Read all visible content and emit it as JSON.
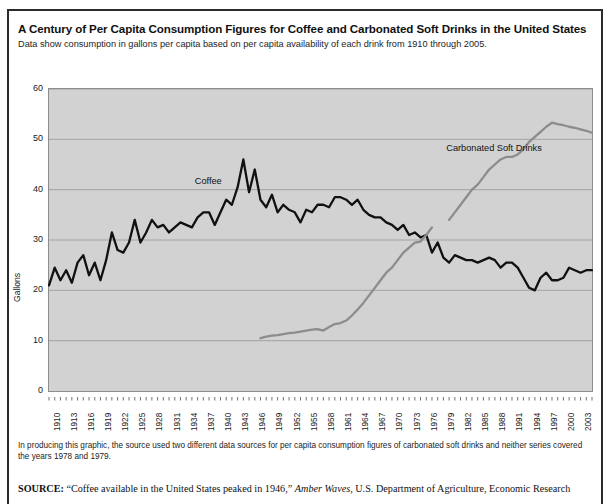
{
  "figure": {
    "title": "A Century of Per Capita Consumption Figures for Coffee and Carbonated Soft Drinks in the United States",
    "subtitle": "Data show consumption in gallons per capita based on per capita availability of each drink from 1910 through 2005.",
    "note": "In producing this graphic, the source used two different data sources for per capita consumption figures of carbonated soft drinks and neither series covered the years 1978 and 1979.",
    "source_prefix": "SOURCE:",
    "source_quote": "“Coffee available in the United States peaked in 1946,”",
    "source_italic": "Amber Waves",
    "source_rest": ", U.S. Department of Agriculture, Economic Research"
  },
  "colors": {
    "plot_background": "#d2d2d2",
    "gridline": "#8d8d8d",
    "coffee_line": "#111111",
    "soda_line": "#8c8c8c",
    "frame": "#2b2b2b",
    "text": "#1b1b1b"
  },
  "chart_data": {
    "type": "line",
    "title": "A Century of Per Capita Consumption Figures for Coffee and Carbonated Soft Drinks in the United States",
    "xlabel": "",
    "ylabel": "Gallons",
    "ylim": [
      0,
      60
    ],
    "xlim": [
      1910,
      2005
    ],
    "yticks": [
      0,
      10,
      20,
      30,
      40,
      50,
      60
    ],
    "xticks": [
      1910,
      1913,
      1916,
      1919,
      1922,
      1925,
      1928,
      1931,
      1934,
      1937,
      1940,
      1943,
      1946,
      1949,
      1952,
      1955,
      1958,
      1961,
      1964,
      1967,
      1970,
      1973,
      1976,
      1979,
      1982,
      1985,
      1988,
      1991,
      1994,
      1997,
      2000,
      2003
    ],
    "grid": true,
    "legend": "inline-labels",
    "series": [
      {
        "name": "Coffee",
        "color": "#111111",
        "label_x": 1939,
        "label_y": 41.5,
        "x": [
          1910,
          1911,
          1912,
          1913,
          1914,
          1915,
          1916,
          1917,
          1918,
          1919,
          1920,
          1921,
          1922,
          1923,
          1924,
          1925,
          1926,
          1927,
          1928,
          1929,
          1930,
          1931,
          1932,
          1933,
          1934,
          1935,
          1936,
          1937,
          1938,
          1939,
          1940,
          1941,
          1942,
          1943,
          1944,
          1945,
          1946,
          1947,
          1948,
          1949,
          1950,
          1951,
          1952,
          1953,
          1954,
          1955,
          1956,
          1957,
          1958,
          1959,
          1960,
          1961,
          1962,
          1963,
          1964,
          1965,
          1966,
          1967,
          1968,
          1969,
          1970,
          1971,
          1972,
          1973,
          1974,
          1975,
          1976,
          1977,
          1978,
          1979,
          1980,
          1981,
          1982,
          1983,
          1984,
          1985,
          1986,
          1987,
          1988,
          1989,
          1990,
          1991,
          1992,
          1993,
          1994,
          1995,
          1996,
          1997,
          1998,
          1999,
          2000,
          2001,
          2002,
          2003,
          2004,
          2005
        ],
        "y": [
          21.0,
          24.5,
          22.0,
          24.0,
          21.5,
          25.5,
          27.0,
          23.0,
          25.5,
          22.0,
          26.0,
          31.5,
          28.0,
          27.5,
          29.5,
          34.0,
          29.5,
          31.5,
          34.0,
          32.5,
          33.0,
          31.5,
          32.5,
          33.5,
          33.0,
          32.5,
          34.5,
          35.5,
          35.5,
          33.0,
          35.5,
          38.0,
          37.0,
          40.5,
          46.0,
          39.5,
          44.0,
          38.0,
          36.5,
          39.0,
          35.5,
          37.0,
          36.0,
          35.5,
          33.5,
          36.0,
          35.5,
          37.0,
          37.0,
          36.5,
          38.5,
          38.5,
          38.0,
          37.0,
          38.0,
          36.0,
          35.0,
          34.5,
          34.5,
          33.5,
          33.0,
          32.0,
          33.0,
          31.0,
          31.5,
          30.5,
          31.0,
          27.5,
          29.5,
          26.5,
          25.5,
          27.0,
          26.5,
          26.0,
          26.0,
          25.5,
          26.0,
          26.5,
          26.0,
          24.5,
          25.5,
          25.5,
          24.5,
          22.5,
          20.5,
          20.0,
          22.5,
          23.5,
          22.0,
          22.0,
          22.5,
          24.5,
          24.0,
          23.5,
          24.0,
          24.0
        ]
      },
      {
        "name": "Carbonated Soft Drinks",
        "color": "#8c8c8c",
        "label_x": 1983,
        "label_y": 48.0,
        "gap_years": [
          1978,
          1979
        ],
        "x": [
          1947,
          1948,
          1949,
          1950,
          1951,
          1952,
          1953,
          1954,
          1955,
          1956,
          1957,
          1958,
          1959,
          1960,
          1961,
          1962,
          1963,
          1964,
          1965,
          1966,
          1967,
          1968,
          1969,
          1970,
          1971,
          1972,
          1973,
          1974,
          1975,
          1976,
          1977,
          1980,
          1981,
          1982,
          1983,
          1984,
          1985,
          1986,
          1987,
          1988,
          1989,
          1990,
          1991,
          1992,
          1993,
          1994,
          1995,
          1996,
          1997,
          1998,
          1999,
          2000,
          2001,
          2002,
          2003,
          2004,
          2005
        ],
        "y": [
          10.5,
          10.8,
          11.0,
          11.1,
          11.3,
          11.5,
          11.6,
          11.8,
          12.0,
          12.2,
          12.3,
          12.0,
          12.7,
          13.3,
          13.5,
          14.0,
          15.0,
          16.2,
          17.5,
          19.0,
          20.5,
          22.0,
          23.5,
          24.5,
          26.0,
          27.5,
          28.5,
          29.5,
          29.7,
          31.0,
          32.5,
          34.0,
          35.5,
          37.0,
          38.5,
          40.0,
          41.0,
          42.5,
          44.0,
          45.0,
          46.0,
          46.5,
          46.5,
          47.0,
          48.0,
          49.5,
          50.5,
          51.5,
          52.5,
          53.3,
          53.0,
          52.8,
          52.5,
          52.3,
          52.0,
          51.7,
          51.3
        ]
      }
    ]
  },
  "axis": {
    "y_title": "Gallons"
  }
}
